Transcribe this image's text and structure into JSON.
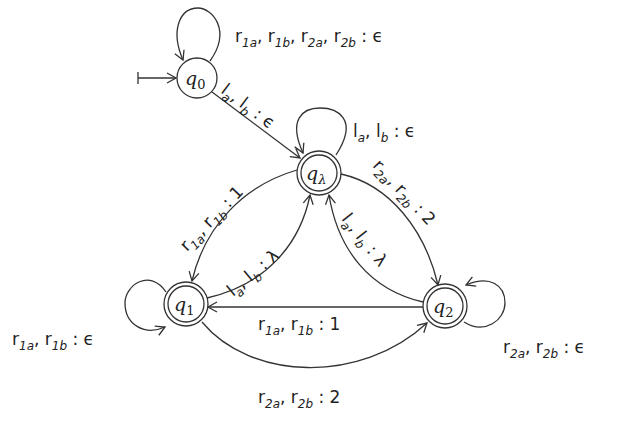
{
  "diagram": {
    "type": "finite-state transducer",
    "states": [
      {
        "id": "q0",
        "label": "q0",
        "sub": "0",
        "initial": true,
        "accepting": false
      },
      {
        "id": "qlambda",
        "label": "q",
        "sub": "λ",
        "initial": false,
        "accepting": true
      },
      {
        "id": "q1",
        "label": "q",
        "sub": "1",
        "initial": false,
        "accepting": true
      },
      {
        "id": "q2",
        "label": "q",
        "sub": "2",
        "initial": false,
        "accepting": true
      }
    ],
    "transitions": [
      {
        "from": "q0",
        "to": "q0",
        "label": "r1a, r1b, r2a, r2b : ϵ"
      },
      {
        "from": "q0",
        "to": "qlambda",
        "label": "la, lb : ϵ"
      },
      {
        "from": "qlambda",
        "to": "qlambda",
        "label": "la, lb : ϵ"
      },
      {
        "from": "qlambda",
        "to": "q1",
        "label": "r1a, r1b : 1"
      },
      {
        "from": "q1",
        "to": "qlambda",
        "label": "la, lb : λ"
      },
      {
        "from": "qlambda",
        "to": "q2",
        "label": "r2a, r2b : 2"
      },
      {
        "from": "q2",
        "to": "qlambda",
        "label": "la, lb : λ"
      },
      {
        "from": "q2",
        "to": "q1",
        "label": "r1a, r1b : 1"
      },
      {
        "from": "q1",
        "to": "q2",
        "label": "r2a, r2b : 2"
      },
      {
        "from": "q1",
        "to": "q1",
        "label": "r1a, r1b : ϵ"
      },
      {
        "from": "q2",
        "to": "q2",
        "label": "r2a, r2b : ϵ"
      }
    ]
  },
  "labels": {
    "q0_q": "q",
    "q0_sub": "0",
    "ql_q": "q",
    "ql_sub": "λ",
    "q1_q": "q",
    "q1_sub": "1",
    "q2_q": "q",
    "q2_sub": "2",
    "loop_q0": [
      "r",
      "1a",
      ", r",
      "1b",
      ", r",
      "2a",
      ", r",
      "2b",
      " : ϵ"
    ],
    "q0_ql": [
      "l",
      "a",
      ", l",
      "b",
      " : ϵ"
    ],
    "loop_ql": [
      "l",
      "a",
      ", l",
      "b",
      " : ϵ"
    ],
    "ql_q1": [
      "r",
      "1a",
      ", r",
      "1b",
      " : 1"
    ],
    "q1_ql": [
      "l",
      "a",
      ", l",
      "b",
      " : λ"
    ],
    "ql_q2": [
      "r",
      "2a",
      ", r",
      "2b",
      " : 2"
    ],
    "q2_ql": [
      "l",
      "a",
      ", l",
      "b",
      " : λ"
    ],
    "q2_q1": [
      "r",
      "1a",
      ", r",
      "1b",
      " : 1"
    ],
    "q1_q2": [
      "r",
      "2a",
      ", r",
      "2b",
      " : 2"
    ],
    "loop_q1": [
      "r",
      "1a",
      ", r",
      "1b",
      " : ϵ"
    ],
    "loop_q2": [
      "r",
      "2a",
      ", r",
      "2b",
      " : ϵ"
    ]
  }
}
